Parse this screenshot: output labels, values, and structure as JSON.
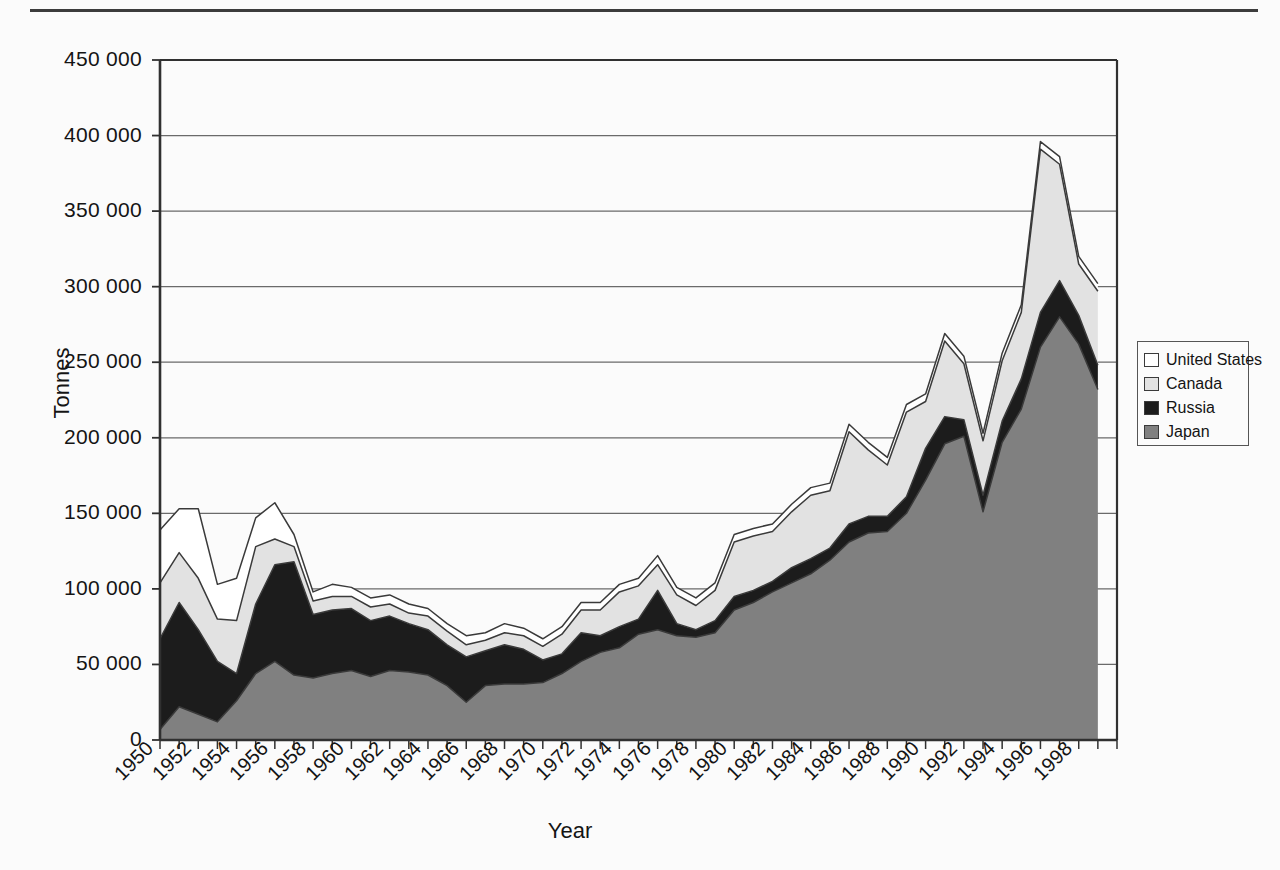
{
  "chart_data": {
    "type": "area",
    "stacked": true,
    "title": "",
    "xlabel": "Year",
    "ylabel": "Tonnes",
    "ylim": [
      0,
      450000
    ],
    "ytick_step": 50000,
    "ytick_labels": [
      "0",
      "50 000",
      "100 000",
      "150 000",
      "200 000",
      "250 000",
      "300 000",
      "350 000",
      "400 000",
      "450 000"
    ],
    "ytick_values": [
      0,
      50000,
      100000,
      150000,
      200000,
      250000,
      300000,
      350000,
      400000,
      450000
    ],
    "xlim": [
      1950,
      2000
    ],
    "xtick_labels": [
      "1950",
      "1952",
      "1954",
      "1956",
      "1958",
      "1960",
      "1962",
      "1964",
      "1966",
      "1968",
      "1970",
      "1972",
      "1974",
      "1976",
      "1978",
      "1980",
      "1982",
      "1984",
      "1986",
      "1988",
      "1990",
      "1992",
      "1994",
      "1996",
      "1998"
    ],
    "xtick_values": [
      1950,
      1952,
      1954,
      1956,
      1958,
      1960,
      1962,
      1964,
      1966,
      1968,
      1970,
      1972,
      1974,
      1976,
      1978,
      1980,
      1982,
      1984,
      1986,
      1988,
      1990,
      1992,
      1994,
      1996,
      1998
    ],
    "xtick_rotation": -45,
    "grid": "horizontal",
    "legend_position": "right",
    "x": [
      1950,
      1951,
      1952,
      1953,
      1954,
      1955,
      1956,
      1957,
      1958,
      1959,
      1960,
      1961,
      1962,
      1963,
      1964,
      1965,
      1966,
      1967,
      1968,
      1969,
      1970,
      1971,
      1972,
      1973,
      1974,
      1975,
      1976,
      1977,
      1978,
      1979,
      1980,
      1981,
      1982,
      1983,
      1984,
      1985,
      1986,
      1987,
      1988,
      1989,
      1990,
      1991,
      1992,
      1993,
      1994,
      1995,
      1996,
      1997,
      1998,
      1999
    ],
    "series": [
      {
        "name": "Japan",
        "color": "#808080",
        "values": [
          7000,
          22000,
          17000,
          12000,
          26000,
          44000,
          52000,
          43000,
          41000,
          44000,
          46000,
          42000,
          46000,
          45000,
          43000,
          36000,
          25000,
          36000,
          37000,
          37000,
          38000,
          44000,
          52000,
          58000,
          61000,
          70000,
          73000,
          69000,
          68000,
          71000,
          86000,
          91000,
          98000,
          104000,
          110000,
          119000,
          131000,
          137000,
          138000,
          150000,
          172000,
          196000,
          201000,
          151000,
          197000,
          219000,
          260000,
          280000,
          262000,
          232000
        ]
      },
      {
        "name": "Russia",
        "color": "#1c1c1c",
        "values": [
          60000,
          69000,
          56000,
          40000,
          18000,
          46000,
          64000,
          75000,
          42000,
          42000,
          41000,
          37000,
          36000,
          32000,
          30000,
          27000,
          30000,
          23000,
          26000,
          23000,
          15000,
          13000,
          19000,
          11000,
          14000,
          10000,
          26000,
          8000,
          5000,
          8000,
          9000,
          8000,
          7000,
          10000,
          10000,
          8000,
          12000,
          11000,
          10000,
          11000,
          21000,
          18000,
          11000,
          11000,
          14000,
          20000,
          23000,
          24000,
          19000,
          16000
        ]
      },
      {
        "name": "Canada",
        "color": "#e2e2e2",
        "values": [
          37000,
          33000,
          34000,
          28000,
          35000,
          38000,
          17000,
          10000,
          9000,
          9000,
          8000,
          9000,
          8000,
          7000,
          9000,
          9000,
          8000,
          7000,
          8000,
          9000,
          9000,
          13000,
          15000,
          17000,
          23000,
          22000,
          17000,
          19000,
          16000,
          20000,
          36000,
          36000,
          33000,
          37000,
          42000,
          38000,
          61000,
          44000,
          34000,
          56000,
          31000,
          50000,
          37000,
          36000,
          40000,
          44000,
          108000,
          77000,
          34000,
          49000
        ]
      },
      {
        "name": "United States",
        "color": "#ffffff",
        "values": [
          35000,
          29000,
          46000,
          23000,
          28000,
          19000,
          24000,
          8000,
          6000,
          8000,
          6000,
          6000,
          6000,
          6000,
          5000,
          5000,
          6000,
          5000,
          6000,
          5000,
          5000,
          5000,
          5000,
          5000,
          5000,
          5000,
          6000,
          5000,
          5000,
          5000,
          5000,
          5000,
          5000,
          5000,
          5000,
          5000,
          5000,
          5000,
          5000,
          5000,
          5000,
          5000,
          5000,
          5000,
          5000,
          5000,
          5000,
          5000,
          5000,
          5000
        ]
      }
    ]
  },
  "axes": {
    "y_title": "Tonnes",
    "x_title": "Year"
  },
  "legend": {
    "items": [
      {
        "label": "United States",
        "color": "#ffffff"
      },
      {
        "label": "Canada",
        "color": "#e2e2e2"
      },
      {
        "label": "Russia",
        "color": "#1c1c1c"
      },
      {
        "label": "Japan",
        "color": "#808080"
      }
    ]
  },
  "style": {
    "axis_color": "#303030",
    "grid_color": "#6a6a6a",
    "line_color": "#3a3a3a",
    "page_background": "#fbfbfb"
  }
}
